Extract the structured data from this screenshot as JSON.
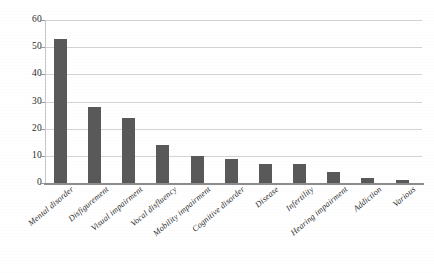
{
  "chart_data": {
    "type": "bar",
    "title": "",
    "subtitle": "",
    "xlabel": "",
    "ylabel": "",
    "ylim": [
      0,
      60
    ],
    "yticks": [
      0,
      10,
      20,
      30,
      40,
      50,
      60
    ],
    "grid": "horizontal",
    "legend": "none",
    "bar_color": "#595959",
    "gridline_color": "#d4d4d4",
    "axis_color": "#8c8c8c",
    "background_color": "#ffffff",
    "categories": [
      "Mental disorder",
      "Disfigurement",
      "Visual impairment",
      "Vocal disfluency",
      "Mobility impairment",
      "Cognitive disorder",
      "Disease",
      "Infertility",
      "Hearing impairment",
      "Addiction",
      "Various"
    ],
    "values": [
      53,
      28,
      24,
      14,
      10,
      9,
      7,
      7,
      4,
      2,
      1
    ]
  }
}
